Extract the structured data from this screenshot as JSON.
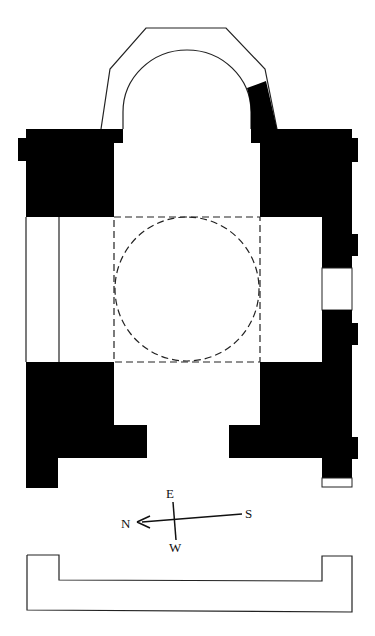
{
  "diagram": {
    "type": "architectural-floor-plan",
    "colors": {
      "wall": "#000000",
      "background": "#ffffff",
      "line": "#222222"
    },
    "compass": {
      "labels": {
        "north": "N",
        "east": "E",
        "south": "S",
        "west": "W"
      }
    },
    "elements": [
      "apse",
      "upper-left-pier",
      "upper-right-pier",
      "left-aisle",
      "dashed-crossing-square",
      "dashed-dome-circle",
      "right-wall-with-window",
      "lower-left-pier",
      "lower-right-pier",
      "compass",
      "base-outline"
    ]
  }
}
